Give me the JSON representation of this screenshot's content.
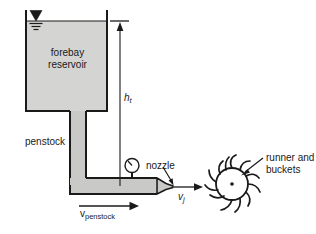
{
  "figure": {
    "labels": {
      "forebay_line1": "forebay",
      "forebay_line2": "reservoir",
      "penstock": "penstock",
      "nozzle": "nozzle",
      "runner_line1": "runner and",
      "runner_line2": "buckets",
      "head_symbol": "h",
      "head_subscript": "t",
      "jet_velocity_symbol": "v",
      "jet_velocity_subscript": "j",
      "penstock_velocity_symbol": "v",
      "penstock_velocity_subscript": "penstock"
    },
    "icons": {
      "water_surface": "water-surface-triangle-icon",
      "pressure_gauge": "pressure-gauge-icon",
      "runner_wheel": "pelton-runner-icon"
    },
    "colors": {
      "outline": "#1a1a1a",
      "reservoir_fill": "#d4d4d2",
      "pipe_fill": "#c9c9c7",
      "background": "#ffffff",
      "text": "#1a1a1a"
    }
  }
}
